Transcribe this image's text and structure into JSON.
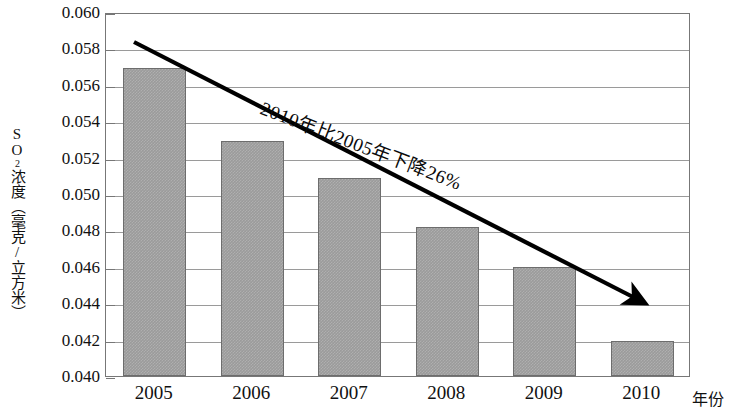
{
  "chart_data": {
    "type": "bar",
    "title": "",
    "subtitle": "",
    "categories": [
      "2005",
      "2006",
      "2007",
      "2008",
      "2009",
      "2010"
    ],
    "values": [
      0.0569,
      0.0529,
      0.0509,
      0.0482,
      0.046,
      0.0419
    ],
    "series": [
      {
        "name": "SO2浓度",
        "values": [
          0.0569,
          0.0529,
          0.0509,
          0.0482,
          0.046,
          0.0419
        ]
      }
    ],
    "xlabel": "年份",
    "ylabel": "SO₂浓度（毫克/立方米）",
    "ylim": [
      0.04,
      0.06
    ],
    "ytick_labels": [
      "0.060",
      "0.058",
      "0.056",
      "0.054",
      "0.052",
      "0.050",
      "0.048",
      "0.046",
      "0.044",
      "0.042",
      "0.040"
    ],
    "ytick_values": [
      0.06,
      0.058,
      0.056,
      0.054,
      0.052,
      0.05,
      0.048,
      0.046,
      0.044,
      0.042,
      0.04
    ],
    "xtick_labels": [
      "2005",
      "2006",
      "2007",
      "2008",
      "2009",
      "2010"
    ],
    "grid": true,
    "legend": false,
    "legend_position": "none",
    "annotations": [
      {
        "text": "2010年比2005年下降26%",
        "type": "trend-label"
      }
    ],
    "trend_arrow": {
      "description": "downward-trend-arrow",
      "from": [
        0.0587,
        0.0
      ],
      "to": [
        0.0435,
        5.2
      ]
    },
    "colors": {
      "bar_fill": "#9b9b9b",
      "bar_border": "#6d6d6d",
      "gridline": "#9a9a9a",
      "axis": "#777777",
      "text": "#111111",
      "arrow": "#000000"
    }
  },
  "axis": {
    "y_title_main": "SO",
    "y_title_sub": "2",
    "y_title_rest": "浓度（毫克/立方米）",
    "x_title": "年份"
  }
}
